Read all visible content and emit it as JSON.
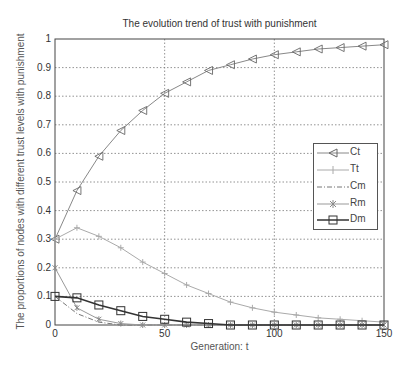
{
  "chart_data": {
    "type": "line",
    "title": "The evolution trend of trust with punishment",
    "xlabel": "Generation: t",
    "ylabel": "The proportions of nodes with different trust levels with punishment",
    "xlim": [
      0,
      150
    ],
    "ylim": [
      0,
      1
    ],
    "xticks": [
      0,
      50,
      100,
      150
    ],
    "yticks": [
      0,
      0.1,
      0.2,
      0.3,
      0.4,
      0.5,
      0.6,
      0.7,
      0.8,
      0.9,
      1
    ],
    "grid": true,
    "legend_position": "right-center",
    "x": [
      0,
      10,
      20,
      30,
      40,
      50,
      60,
      70,
      80,
      90,
      100,
      110,
      120,
      130,
      140,
      150
    ],
    "series": [
      {
        "name": "Ct",
        "marker": "triangle-left",
        "line": "solid",
        "color": "#888888",
        "values": [
          0.3,
          0.47,
          0.59,
          0.68,
          0.75,
          0.81,
          0.85,
          0.89,
          0.91,
          0.93,
          0.945,
          0.955,
          0.965,
          0.97,
          0.975,
          0.98
        ]
      },
      {
        "name": "Tt",
        "marker": "plus",
        "line": "solid",
        "color": "#aaaaaa",
        "values": [
          0.3,
          0.34,
          0.31,
          0.27,
          0.22,
          0.18,
          0.14,
          0.11,
          0.08,
          0.06,
          0.045,
          0.035,
          0.025,
          0.02,
          0.015,
          0.01
        ]
      },
      {
        "name": "Cm",
        "marker": "none",
        "line": "dash-dot",
        "color": "#777777",
        "values": [
          0.1,
          0.04,
          0.01,
          0.0,
          0.0,
          0.0,
          0.0,
          0.0,
          0.0,
          0.0,
          0.0,
          0.0,
          0.0,
          0.0,
          0.0,
          0.0
        ]
      },
      {
        "name": "Rm",
        "marker": "star",
        "line": "solid",
        "color": "#999999",
        "values": [
          0.2,
          0.06,
          0.02,
          0.005,
          0.0,
          0.0,
          0.0,
          0.0,
          0.0,
          0.0,
          0.0,
          0.0,
          0.0,
          0.0,
          0.0,
          0.0
        ]
      },
      {
        "name": "Dm",
        "marker": "square",
        "line": "solid",
        "color": "#333333",
        "values": [
          0.1,
          0.095,
          0.07,
          0.05,
          0.03,
          0.02,
          0.01,
          0.005,
          0.0,
          0.0,
          0.0,
          0.0,
          0.0,
          0.0,
          0.0,
          0.0
        ]
      }
    ]
  }
}
